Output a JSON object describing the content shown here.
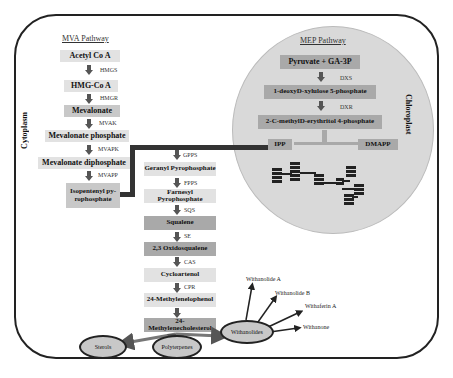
{
  "figure": {
    "compartments": {
      "cytoplasm": "Cytoplasm",
      "chloroplast": "Chloroplast"
    },
    "mva": {
      "title": "MVA Pathway",
      "steps": [
        {
          "label": "Acetyl Co A",
          "enzyme": "HMGS"
        },
        {
          "label": "HMG-Co A",
          "enzyme": "HMGR"
        },
        {
          "label": "Mevalonate",
          "enzyme": "MVAK"
        },
        {
          "label": "Mevalonate phosphate",
          "enzyme": "MVAPK"
        },
        {
          "label": "Mevalonate diphosphate",
          "enzyme": "MVAPP"
        },
        {
          "label": "Isopentenyl py-rophosphate"
        }
      ]
    },
    "mep": {
      "title": "MEP Pathway",
      "steps": [
        {
          "label": "Pyruvate + GA-3P",
          "enzyme": "DXS"
        },
        {
          "label": "1-deoxyD-xylulose 5-phosphate",
          "enzyme": "DXR"
        },
        {
          "label": "2-C-methylD-erythritol 4-phosphate"
        }
      ],
      "ipp": "IPP",
      "dmapp": "DMAPP"
    },
    "sterol_path": {
      "steps": [
        {
          "label": "Geranyl Pyrophosphate",
          "enzyme_before": "FPPS",
          "enzyme_after": "FPPS"
        },
        {
          "label": "Farnesyl Pyrophosphate",
          "enzyme_after": "SQS"
        },
        {
          "label": "Squalene",
          "enzyme_after": "SE"
        },
        {
          "label": "2,3 Oxidosqualene",
          "enzyme_after": "CAS"
        },
        {
          "label": "Cycloartenol",
          "enzyme_after": "CPR"
        },
        {
          "label": "24-Methylenelophenol"
        },
        {
          "label": "24-Methylenecholesterol"
        }
      ],
      "enzyme_gpps": "GPPS"
    },
    "products": {
      "sterols": "Sterols",
      "polyterpenes": "Polyterpenes",
      "withanolides": "Withanolides",
      "withanolide_list": [
        "Withanolide A",
        "Withanolide B",
        "Withaferin A",
        "Withanone"
      ]
    }
  }
}
